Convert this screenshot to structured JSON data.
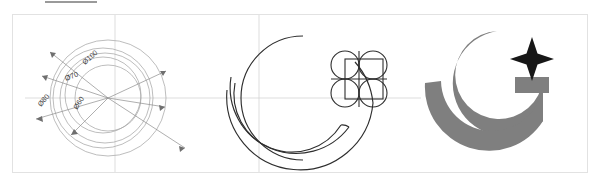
{
  "sheet": {
    "title": "Logo construction sheet",
    "background_color": "#ffffff",
    "frame_color": "#e2e2e2",
    "top_rule_color": "#9a9a9a"
  },
  "panels": [
    {
      "id": "dimensions",
      "name": "dimension-diagram",
      "label": "Dimensioned circle grid",
      "stroke_color": "#a9a9a9",
      "centerline_color": "#c9c9c9",
      "dimension_labels": [
        {
          "text": "Ø100",
          "angle": -42,
          "x": 78,
          "y": 45
        },
        {
          "text": "Ø70",
          "angle": -24,
          "x": 56,
          "y": 58
        },
        {
          "text": "Ø80",
          "angle": -52,
          "x": 26,
          "y": 78
        },
        {
          "text": "Ø60",
          "angle": -58,
          "x": 62,
          "y": 88
        }
      ],
      "circles": [
        {
          "label": "Ø100",
          "r": 58
        },
        {
          "label": "Ø80",
          "r": 50
        },
        {
          "label": "Ø70",
          "r": 45
        },
        {
          "label": "Ø60",
          "r": 33
        }
      ]
    },
    {
      "id": "construction",
      "name": "construction-outline-logo",
      "label": "Crescent and four-circle star construction outline",
      "stroke_color": "#2b2b2b",
      "centerline_color": "#c9c9c9",
      "elements": [
        "crescent-outline",
        "inner-sweep-arc",
        "outer-sweep-arc",
        "four-circle-star-grid",
        "square-overlay"
      ]
    },
    {
      "id": "final",
      "name": "final-logo",
      "label": "Final filled logo",
      "crescent_color": "#7f7f7f",
      "star_color": "#1a1a1a",
      "elements": [
        "gray-crescent",
        "black-four-point-star",
        "gray-tip-block"
      ]
    }
  ]
}
